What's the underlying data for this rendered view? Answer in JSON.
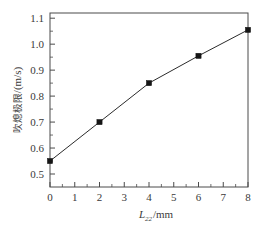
{
  "chart_data": {
    "type": "line",
    "title": "",
    "xlabel": "L22/mm",
    "xlabel_base": "L",
    "xlabel_sub": "22",
    "xlabel_unit": "/mm",
    "ylabel": "吹熄极限/(m/s)",
    "ylabel_cjk": "吹熄极限",
    "ylabel_unit": "/(m/s)",
    "x": [
      0,
      2,
      4,
      6,
      8
    ],
    "values": [
      0.55,
      0.7,
      0.85,
      0.955,
      1.055
    ],
    "series": [
      {
        "name": "吹熄极限",
        "values": [
          0.55,
          0.7,
          0.85,
          0.955,
          1.055
        ]
      }
    ],
    "xlim": [
      0,
      8
    ],
    "ylim": [
      0.45,
      1.12
    ],
    "xticks": [
      0,
      1,
      2,
      3,
      4,
      5,
      6,
      7,
      8
    ],
    "xtick_labels": [
      "0",
      "1",
      "2",
      "3",
      "4",
      "5",
      "6",
      "7",
      "8"
    ],
    "yticks": [
      0.5,
      0.6,
      0.7,
      0.8,
      0.9,
      1.0,
      1.1
    ],
    "ytick_labels": [
      "0.5",
      "0.6",
      "0.7",
      "0.8",
      "0.9",
      "1.0",
      "1.1"
    ],
    "grid": false,
    "legend": false,
    "legend_position": "none",
    "marker": "square",
    "marker_color": "#151515",
    "line_color": "#2b2b2b",
    "axis_color": "#4a4a4a",
    "background_color": "#ffffff"
  }
}
